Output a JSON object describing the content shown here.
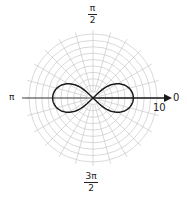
{
  "chart_data": {
    "type": "line",
    "subtype": "polar",
    "title": "",
    "curve": "lemniscate",
    "equation_estimate": "r^2 = 40 cos(2θ)",
    "r_max": 10,
    "r_rings": [
      1,
      2,
      3,
      4,
      5,
      6,
      7,
      8,
      9,
      10
    ],
    "spoke_step_radians": 0.2618,
    "spoke_count": 24,
    "loop_tip_radius": 6.3,
    "angle_labels": {
      "zero": "0",
      "half_pi_num": "π",
      "half_pi_den": "2",
      "pi": "π",
      "three_half_pi_num": "3π",
      "three_half_pi_den": "2"
    },
    "radius_label": "10",
    "grid": true,
    "polar_axis_arrow": true
  },
  "colors": {
    "grid": "#c8c8c8",
    "curve": "#1a1a1a",
    "axis": "#1a1a1a",
    "text": "#222222"
  }
}
